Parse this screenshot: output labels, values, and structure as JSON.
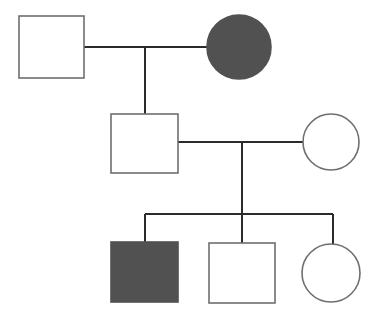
{
  "diagram": {
    "type": "pedigree",
    "canvas": {
      "width": 375,
      "height": 327,
      "background": "#ffffff"
    },
    "style": {
      "stroke_color": "#6f6f6f",
      "line_color": "#2b2b2b",
      "affected_fill": "#515151",
      "unaffected_fill": "#ffffff",
      "shape_stroke_width": 1.6,
      "line_stroke_width": 1.7
    },
    "legend_semantics": {
      "square": "male",
      "circle": "female",
      "filled": "affected",
      "open": "unaffected"
    },
    "generations": [
      {
        "id": "I",
        "label": "Generation I",
        "individuals": [
          {
            "id": "I-1",
            "name": "generation-1-male-unaffected",
            "sex": "male",
            "shape": "square",
            "status": "unaffected",
            "fill": "#ffffff",
            "x": 19,
            "y": 16,
            "width": 65,
            "height": 62
          },
          {
            "id": "I-2",
            "name": "generation-1-female-affected",
            "sex": "female",
            "shape": "circle",
            "status": "affected",
            "fill": "#515151",
            "cx": 239,
            "cy": 47,
            "r": 32
          }
        ],
        "mating_line": {
          "x1": 84,
          "y1": 47,
          "x2": 207,
          "y2": 47
        },
        "descent_line": {
          "x1": 145,
          "y1": 47,
          "x2": 145,
          "y2": 114
        }
      },
      {
        "id": "II",
        "label": "Generation II",
        "individuals": [
          {
            "id": "II-1",
            "name": "generation-2-male-unaffected",
            "sex": "male",
            "shape": "square",
            "status": "unaffected",
            "fill": "#ffffff",
            "x": 111,
            "y": 114,
            "width": 67,
            "height": 59
          },
          {
            "id": "II-2",
            "name": "generation-2-female-unaffected",
            "sex": "female",
            "shape": "circle",
            "status": "unaffected",
            "fill": "#ffffff",
            "cx": 331,
            "cy": 142,
            "r": 28
          }
        ],
        "mating_line": {
          "x1": 178,
          "y1": 142,
          "x2": 303,
          "y2": 142
        },
        "descent_line": {
          "x1": 242,
          "y1": 142,
          "x2": 242,
          "y2": 214
        },
        "sibship_line": {
          "x1": 145,
          "y1": 214,
          "x2": 333,
          "y2": 214
        }
      },
      {
        "id": "III",
        "label": "Generation III",
        "individuals": [
          {
            "id": "III-1",
            "name": "generation-3-male-affected",
            "sex": "male",
            "shape": "square",
            "status": "affected",
            "fill": "#515151",
            "x": 111,
            "y": 242,
            "width": 67,
            "height": 60,
            "drop_line": {
              "x1": 145,
              "y1": 214,
              "x2": 145,
              "y2": 242
            }
          },
          {
            "id": "III-2",
            "name": "generation-3-male-unaffected",
            "sex": "male",
            "shape": "square",
            "status": "unaffected",
            "fill": "#ffffff",
            "x": 209,
            "y": 243,
            "width": 66,
            "height": 60,
            "drop_line": {
              "x1": 242,
              "y1": 214,
              "x2": 242,
              "y2": 243
            }
          },
          {
            "id": "III-3",
            "name": "generation-3-female-unaffected",
            "sex": "female",
            "shape": "circle",
            "status": "unaffected",
            "fill": "#ffffff",
            "cx": 331,
            "cy": 273,
            "r": 29,
            "drop_line": {
              "x1": 333,
              "y1": 214,
              "x2": 333,
              "y2": 244
            }
          }
        ]
      }
    ]
  }
}
